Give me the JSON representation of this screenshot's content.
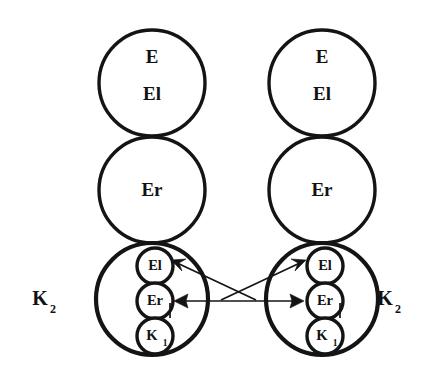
{
  "diagram": {
    "background_color": "#ffffff",
    "stroke_color": "#141414",
    "units": [
      {
        "id": "left-unit",
        "side": "left",
        "side_label": "K",
        "side_label_subscript": "2",
        "circles": [
          {
            "id": "left-top",
            "label_line1": "E",
            "label_line2": "El",
            "role": "top-circle"
          },
          {
            "id": "left-middle",
            "label_line1": "Er",
            "label_line2": "",
            "role": "middle-circle"
          },
          {
            "id": "left-bottom",
            "label_line1": "",
            "label_line2": "",
            "role": "bottom-circle",
            "inner_circles": [
              {
                "id": "left-inner-el",
                "label": "El",
                "subscript": ""
              },
              {
                "id": "left-inner-er",
                "label": "Er",
                "subscript": ""
              },
              {
                "id": "left-inner-k1",
                "label": "K",
                "subscript": "1"
              }
            ]
          }
        ]
      },
      {
        "id": "right-unit",
        "side": "right",
        "side_label": "K",
        "side_label_subscript": "2",
        "circles": [
          {
            "id": "right-top",
            "label_line1": "E",
            "label_line2": "El",
            "role": "top-circle"
          },
          {
            "id": "right-middle",
            "label_line1": "Er",
            "label_line2": "",
            "role": "middle-circle"
          },
          {
            "id": "right-bottom",
            "label_line1": "",
            "label_line2": "",
            "role": "bottom-circle",
            "inner_circles": [
              {
                "id": "right-inner-el",
                "label": "El",
                "subscript": ""
              },
              {
                "id": "right-inner-er",
                "label": "Er",
                "subscript": ""
              },
              {
                "id": "right-inner-k1",
                "label": "K",
                "subscript": "1"
              }
            ]
          }
        ]
      }
    ],
    "connectors": [
      {
        "id": "conn-horizontal-left",
        "from": "right-inner-er",
        "to": "left-inner-er",
        "style": "arrow"
      },
      {
        "id": "conn-horizontal-right",
        "from": "left-inner-er",
        "to": "right-inner-er",
        "style": "arrow"
      },
      {
        "id": "conn-diagonal-left",
        "from": "right-side-junction",
        "to": "left-inner-el",
        "style": "arrow"
      },
      {
        "id": "conn-diagonal-right",
        "from": "left-side-junction",
        "to": "right-inner-el",
        "style": "arrow"
      }
    ]
  }
}
